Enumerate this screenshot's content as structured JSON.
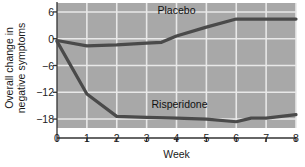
{
  "chart_data": {
    "type": "line",
    "title": "",
    "xlabel": "Week",
    "ylabel": "Overall change in negative symptoms",
    "ylabel_line1": "Overall change in",
    "ylabel_line2": "negative symptoms",
    "x": [
      0,
      1,
      2,
      3,
      4,
      5,
      6,
      7,
      8
    ],
    "xlim": [
      0,
      8
    ],
    "ylim": [
      -20,
      8
    ],
    "xticks": [
      "0",
      "1",
      "2",
      "3",
      "4",
      "5",
      "6",
      "7",
      "8"
    ],
    "yticks": [
      "6",
      "0",
      "−6",
      "−12",
      "−18"
    ],
    "ytick_values": [
      6,
      0,
      -6,
      -12,
      -18
    ],
    "grid": true,
    "legend_position": "inline-labels",
    "plot_background": "#a8a8a8",
    "gridline_color": "#e8e8e8",
    "series": [
      {
        "name": "Placebo",
        "color": "#4a4a4a",
        "label_x": 4.0,
        "label_y": 6.4,
        "points": [
          {
            "x": 0,
            "y": -0.4
          },
          {
            "x": 1,
            "y": -1.6
          },
          {
            "x": 2,
            "y": -1.4
          },
          {
            "x": 3,
            "y": -1.0
          },
          {
            "x": 3.5,
            "y": -0.8
          },
          {
            "x": 4,
            "y": 0.6
          },
          {
            "x": 5,
            "y": 2.6
          },
          {
            "x": 6,
            "y": 4.4
          },
          {
            "x": 7,
            "y": 4.4
          },
          {
            "x": 8,
            "y": 4.4
          }
        ],
        "values": [
          -0.4,
          -1.6,
          -1.4,
          -1.0,
          0.6,
          2.6,
          4.4,
          4.4,
          4.4
        ]
      },
      {
        "name": "Risperidone",
        "color": "#4a4a4a",
        "label_x": 4.1,
        "label_y": -14.6,
        "points": [
          {
            "x": 0,
            "y": -0.6
          },
          {
            "x": 1,
            "y": -12.4
          },
          {
            "x": 2,
            "y": -17.4
          },
          {
            "x": 3,
            "y": -17.6
          },
          {
            "x": 4,
            "y": -17.8
          },
          {
            "x": 5,
            "y": -18.0
          },
          {
            "x": 6,
            "y": -18.6
          },
          {
            "x": 6.5,
            "y": -17.8
          },
          {
            "x": 7,
            "y": -17.8
          },
          {
            "x": 8,
            "y": -17.0
          }
        ],
        "values": [
          -0.6,
          -12.4,
          -17.4,
          -17.6,
          -17.8,
          -18.0,
          -18.6,
          -17.8,
          -17.0
        ]
      }
    ]
  }
}
